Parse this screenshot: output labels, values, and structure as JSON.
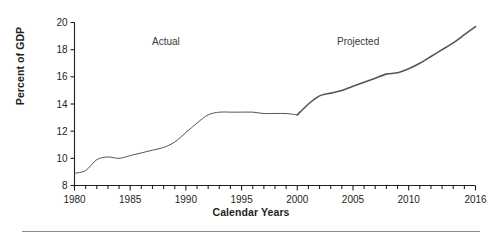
{
  "figure": {
    "ylabel": "Percent of GDP",
    "xlabel": "Calendar Years",
    "annotations": {
      "actual": "Actual",
      "projected": "Projected"
    }
  },
  "chart_data": {
    "type": "line",
    "title": "",
    "xlabel": "Calendar Years",
    "ylabel": "Percent of GDP",
    "xlim": [
      1980,
      2016
    ],
    "ylim": [
      8,
      20
    ],
    "ytick_labels": [
      "8",
      "10",
      "12",
      "14",
      "16",
      "18",
      "20"
    ],
    "ytick_values": [
      8,
      10,
      12,
      14,
      16,
      18,
      20
    ],
    "xtick_labels": [
      "1980",
      "1985",
      "1990",
      "1995",
      "2000",
      "2005",
      "2010",
      "2016"
    ],
    "xtick_values": [
      1980,
      1985,
      1990,
      1995,
      2000,
      2005,
      2010,
      2016
    ],
    "minor_xticks_every": 1,
    "grid": false,
    "legend": "none",
    "annotations": [
      {
        "text": "Actual",
        "x": 1987,
        "y": 18.8
      },
      {
        "text": "Projected",
        "x": 2003.5,
        "y": 18.8
      }
    ],
    "line_color": "#555555",
    "series": [
      {
        "name": "Actual",
        "x": [
          1980,
          1981,
          1982,
          1983,
          1984,
          1985,
          1986,
          1987,
          1988,
          1989,
          1990,
          1991,
          1992,
          1993,
          1994,
          1995,
          1996,
          1997,
          1998,
          1999,
          2000
        ],
        "values": [
          8.9,
          9.1,
          9.9,
          10.1,
          10.0,
          10.2,
          10.4,
          10.6,
          10.8,
          11.2,
          11.9,
          12.6,
          13.2,
          13.4,
          13.4,
          13.4,
          13.4,
          13.3,
          13.3,
          13.3,
          13.2
        ]
      },
      {
        "name": "Projected",
        "x": [
          2000,
          2001,
          2002,
          2003,
          2004,
          2005,
          2006,
          2007,
          2008,
          2009,
          2010,
          2011,
          2012,
          2013,
          2014,
          2015,
          2016
        ],
        "values": [
          13.2,
          14.0,
          14.6,
          14.8,
          15.0,
          15.3,
          15.6,
          15.9,
          16.2,
          16.3,
          16.6,
          17.0,
          17.5,
          18.0,
          18.5,
          19.1,
          19.7
        ]
      }
    ]
  }
}
